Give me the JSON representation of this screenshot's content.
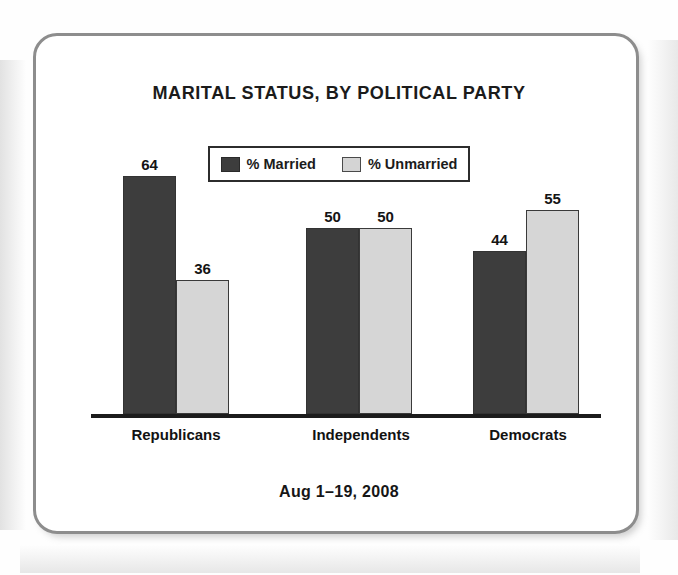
{
  "chart_data": {
    "type": "bar",
    "title": "MARITAL STATUS, BY POLITICAL PARTY",
    "subtitle": "",
    "footnote": "Aug 1–19, 2008",
    "xlabel": "",
    "ylabel": "",
    "ylim": [
      0,
      70
    ],
    "grid": false,
    "legend_position": "top-center",
    "categories": [
      "Republicans",
      "Independents",
      "Democrats"
    ],
    "series": [
      {
        "name": "% Married",
        "color": "#3d3d3d",
        "values": [
          64,
          50,
          44
        ]
      },
      {
        "name": "% Unmarried",
        "color": "#d6d6d6",
        "values": [
          36,
          50,
          55
        ]
      }
    ],
    "data_labels": [
      {
        "category": "Republicans",
        "married": 64,
        "unmarried": 36
      },
      {
        "category": "Independents",
        "married": 50,
        "unmarried": 50
      },
      {
        "category": "Democrats",
        "married": 44,
        "unmarried": 55
      }
    ]
  },
  "colors": {
    "married_fill": "#3d3d3d",
    "unmarried_fill": "#d6d6d6",
    "bar_outline": "#3a3a3a",
    "axis": "#1c1c1c",
    "card_border": "#8d8d8d",
    "text": "#141414",
    "background": "#ffffff"
  }
}
